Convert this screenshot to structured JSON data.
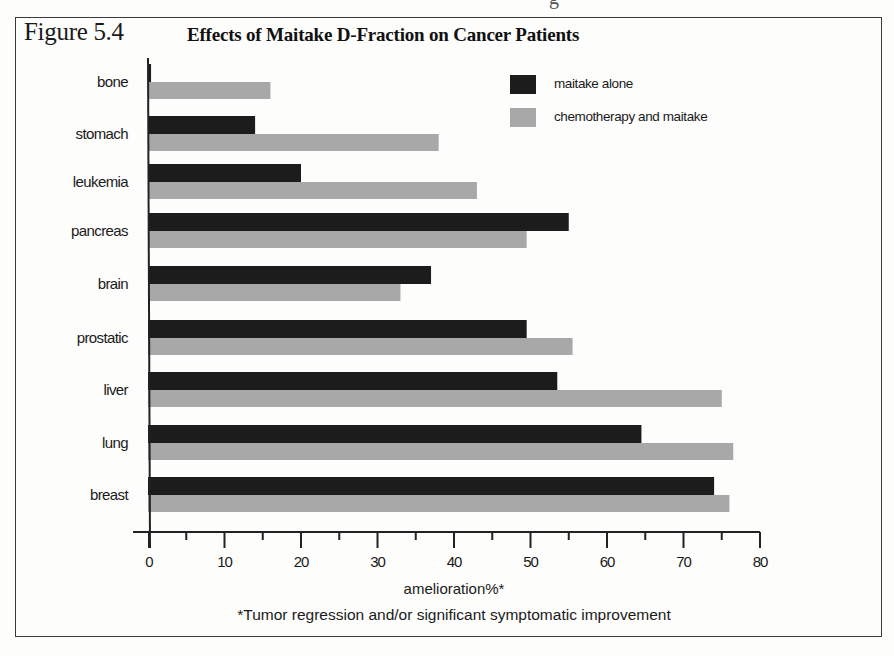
{
  "page_fragment": "g",
  "figure": {
    "label": "Figure 5.4",
    "title": "Effects of Maitake D-Fraction on Cancer Patients",
    "footnote": "*Tumor regression and/or significant symptomatic improvement"
  },
  "colors": {
    "maitake_alone": "#1c1c1c",
    "chemo_and_maitake": "#a8a8a8",
    "axis": "#222222",
    "text": "#1a1a1a"
  },
  "chart_data": {
    "type": "bar",
    "orientation": "horizontal",
    "title": "Effects of Maitake D-Fraction on Cancer Patients",
    "xlabel": "amelioration%*",
    "ylabel": "",
    "xlim": [
      0,
      80
    ],
    "xticks": [
      0,
      10,
      20,
      30,
      40,
      50,
      60,
      70,
      80
    ],
    "minor_tick_step": 5,
    "grid": false,
    "legend_position": "upper right",
    "categories": [
      "bone",
      "stomach",
      "leukemia",
      "pancreas",
      "brain",
      "prostatic",
      "liver",
      "lung",
      "breast"
    ],
    "series": [
      {
        "name": "maitake alone",
        "color": "#1c1c1c",
        "values": [
          0.4,
          14,
          20,
          55,
          37,
          49.5,
          53.5,
          64.5,
          74
        ]
      },
      {
        "name": "chemotherapy and maitake",
        "color": "#a8a8a8",
        "values": [
          16,
          38,
          43,
          49.5,
          33,
          55.5,
          75,
          76.5,
          76
        ]
      }
    ],
    "footnote": "*Tumor regression and/or significant symptomatic improvement"
  }
}
